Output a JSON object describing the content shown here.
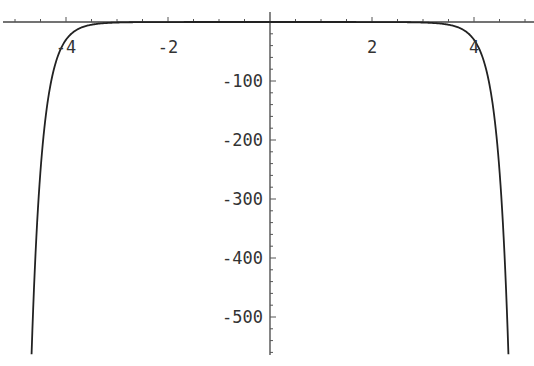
{
  "chart_data": {
    "type": "line",
    "title": "",
    "xlabel": "",
    "ylabel": "",
    "xlim": [
      -5.25,
      5.2
    ],
    "ylim": [
      -563,
      0
    ],
    "grid": false,
    "legend": null,
    "x_ticks": [
      -4,
      -2,
      2,
      4
    ],
    "x_tick_labels": [
      "-4",
      "-2",
      "2",
      "4"
    ],
    "y_ticks": [
      -100,
      -200,
      -300,
      -400,
      -500
    ],
    "y_tick_labels": [
      "-100",
      "-200",
      "-300",
      "-400",
      "-500"
    ],
    "series": [
      {
        "name": "f(x)",
        "description": "even function, ~0 near center, dropping steeply beyond |x|>3.5",
        "x": [
          -4.65,
          -4.5,
          -4.4,
          -4.2,
          -4.0,
          -3.8,
          -3.5,
          -3.0,
          -2.0,
          0,
          2.0,
          3.0,
          3.5,
          3.8,
          4.0,
          4.2,
          4.4,
          4.5,
          4.65
        ],
        "y": [
          -560,
          -250,
          -160,
          -68,
          -30,
          -14,
          -4.5,
          -0.9,
          -0.07,
          -0.01,
          -0.07,
          -0.9,
          -4.5,
          -14,
          -30,
          -68,
          -160,
          -250,
          -560
        ]
      }
    ]
  },
  "axes": {
    "x_labels": [
      "-4",
      "-2",
      "2",
      "4"
    ],
    "y_labels": [
      "-100",
      "-200",
      "-300",
      "-400",
      "-500"
    ]
  }
}
